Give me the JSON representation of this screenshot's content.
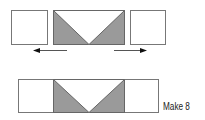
{
  "diagram": {
    "type": "quilt-block-assembly",
    "colors": {
      "fill": "#999999",
      "stroke": "#666666",
      "background": "#ffffff",
      "arrow": "#111111"
    },
    "step1": {
      "left_square": {
        "x": 11,
        "y": 10,
        "w": 36,
        "h": 34
      },
      "flying_geese": {
        "x": 53,
        "y": 10,
        "w": 71,
        "h": 34,
        "apex_x": 88.5
      },
      "right_square": {
        "x": 130,
        "y": 10,
        "w": 35,
        "h": 34
      },
      "arrows": [
        {
          "direction": "left",
          "x1": 67,
          "x2": 33,
          "y": 50
        },
        {
          "direction": "right",
          "x1": 114,
          "x2": 147,
          "y": 50
        }
      ]
    },
    "step2": {
      "strip": {
        "x": 18,
        "y": 79,
        "w": 140,
        "h": 33,
        "divider1": 53,
        "divider2": 124,
        "apex_x": 88.5
      },
      "caption": "Make 8"
    }
  }
}
